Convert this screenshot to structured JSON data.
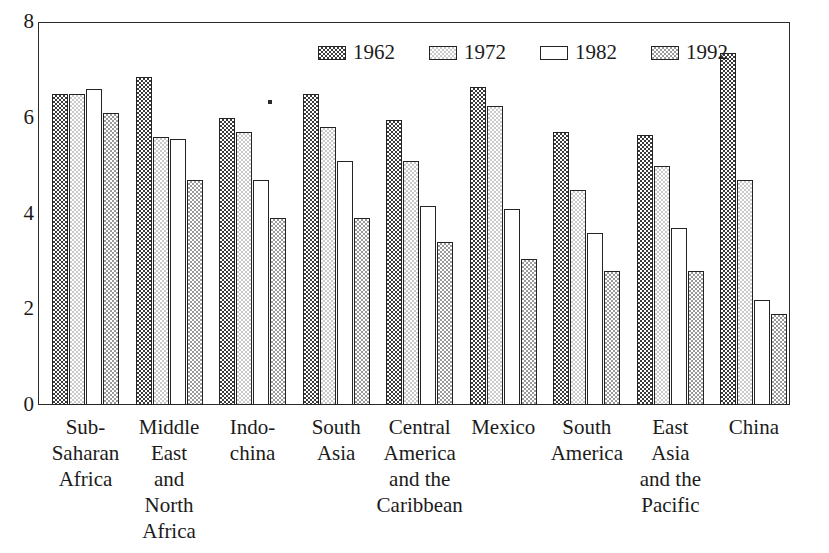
{
  "chart_data": {
    "type": "bar",
    "title": "",
    "xlabel": "",
    "ylabel": "",
    "ylim": [
      0,
      8
    ],
    "yticks": [
      0,
      2,
      4,
      6,
      8
    ],
    "ytick_labels": [
      "0",
      "2",
      "4",
      "6",
      "8"
    ],
    "grid": false,
    "legend_position": "top-center",
    "categories": [
      "Sub-\nSaharan\nAfrica",
      "Middle\nEast\nand\nNorth\nAfrica",
      "Indo-\nchina",
      "South\nAsia",
      "Central\nAmerica\nand the\nCaribbean",
      "Mexico",
      "South\nAmerica",
      "East\nAsia\nand the\nPacific",
      "China"
    ],
    "category_labels_flat": [
      "Sub-Saharan Africa",
      "Middle East and North Africa",
      "Indo-china",
      "South Asia",
      "Central America and the Caribbean",
      "Mexico",
      "South America",
      "East Asia and the Pacific",
      "China"
    ],
    "series": [
      {
        "name": "1962",
        "pattern": "dark-checker",
        "color": "#3b3b3b",
        "values": [
          6.5,
          6.85,
          6.0,
          6.5,
          5.95,
          6.65,
          5.7,
          5.65,
          7.35
        ]
      },
      {
        "name": "1972",
        "pattern": "light-checker",
        "color": "#c9c9c9",
        "values": [
          6.5,
          5.6,
          5.7,
          5.8,
          5.1,
          6.25,
          4.5,
          5.0,
          4.7
        ]
      },
      {
        "name": "1982",
        "pattern": "empty",
        "color": "#ffffff",
        "values": [
          6.6,
          5.55,
          4.7,
          5.1,
          4.15,
          4.1,
          3.6,
          3.7,
          2.2
        ]
      },
      {
        "name": "1992",
        "pattern": "medium-checker",
        "color": "#9a9a9a",
        "values": [
          6.1,
          4.7,
          3.9,
          3.9,
          3.4,
          3.05,
          2.8,
          2.8,
          1.9
        ]
      }
    ]
  },
  "legend": {
    "entries": [
      {
        "label": "1962"
      },
      {
        "label": "1972"
      },
      {
        "label": "1982"
      },
      {
        "label": "1992"
      }
    ]
  }
}
